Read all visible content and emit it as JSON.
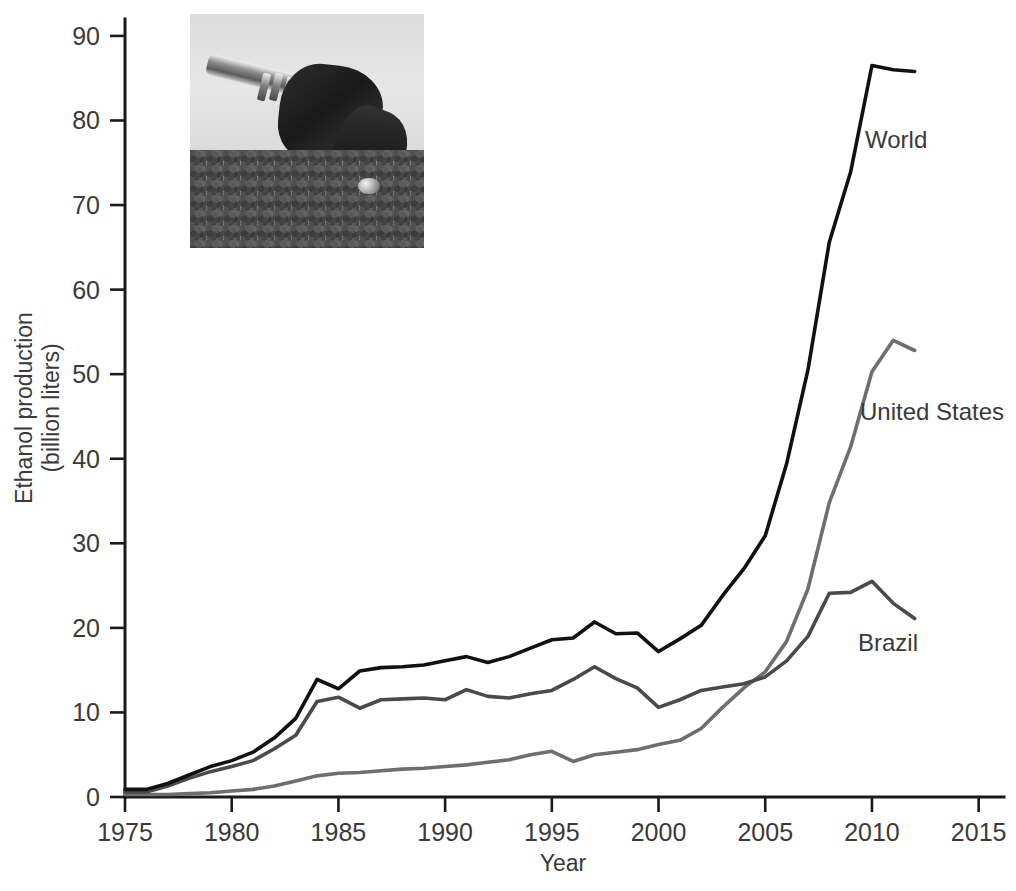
{
  "figure": {
    "background_color": "#ffffff",
    "inset_photo": {
      "name": "fuel-nozzle-on-corn-kernels-photo",
      "description": "Grayscale photograph of a fuel pump nozzle resting on a pile of grain kernels",
      "x": 190,
      "y": 14,
      "width": 234,
      "height": 234
    }
  },
  "chart_data": {
    "type": "line",
    "title": "",
    "xlabel": "Year",
    "ylabel": "Ethanol production (billion liters)",
    "ylabel_line1": "Ethanol production",
    "ylabel_line2": "(billion liters)",
    "xlim": [
      1975,
      2016
    ],
    "ylim": [
      0,
      92
    ],
    "xticks": [
      1975,
      1980,
      1985,
      1990,
      1995,
      2000,
      2005,
      2010,
      2015
    ],
    "xtick_labels": [
      "1975",
      "1980",
      "1985",
      "1990",
      "1995",
      "2000",
      "2005",
      "2010",
      "2015"
    ],
    "yticks": [
      0,
      10,
      20,
      30,
      40,
      50,
      60,
      70,
      80,
      90
    ],
    "ytick_labels": [
      "0",
      "10",
      "20",
      "30",
      "40",
      "50",
      "60",
      "70",
      "80",
      "90"
    ],
    "grid": false,
    "legend_position": "inline-labels-right",
    "x": [
      1975,
      1976,
      1977,
      1978,
      1979,
      1980,
      1981,
      1982,
      1983,
      1984,
      1985,
      1986,
      1987,
      1988,
      1989,
      1990,
      1991,
      1992,
      1993,
      1994,
      1995,
      1996,
      1997,
      1998,
      1999,
      2000,
      2001,
      2002,
      2003,
      2004,
      2005,
      2006,
      2007,
      2008,
      2009,
      2010,
      2011,
      2012
    ],
    "series": [
      {
        "name": "World",
        "color": "#111111",
        "stroke_width": 3.6,
        "label": "World",
        "label_x": 865,
        "label_y": 148,
        "values": [
          0.9,
          0.9,
          1.6,
          2.6,
          3.6,
          4.3,
          5.3,
          7.0,
          9.3,
          13.9,
          12.8,
          14.9,
          15.3,
          15.4,
          15.6,
          16.1,
          16.6,
          15.9,
          16.6,
          17.6,
          18.6,
          18.8,
          20.7,
          19.3,
          19.4,
          17.2,
          18.7,
          20.3,
          23.8,
          27.0,
          30.9,
          39.4,
          50.5,
          65.6,
          73.9,
          86.5,
          86.0,
          85.8
        ]
      },
      {
        "name": "United States",
        "color": "#6e6e6e",
        "stroke_width": 3.6,
        "label": "United States",
        "label_x": 860,
        "label_y": 420,
        "values": [
          0.3,
          0.3,
          0.3,
          0.4,
          0.5,
          0.7,
          0.9,
          1.3,
          1.9,
          2.5,
          2.8,
          2.9,
          3.1,
          3.3,
          3.4,
          3.6,
          3.8,
          4.1,
          4.4,
          5.0,
          5.4,
          4.2,
          5.0,
          5.3,
          5.6,
          6.2,
          6.7,
          8.1,
          10.6,
          12.9,
          14.8,
          18.4,
          24.6,
          34.8,
          41.4,
          50.3,
          54.0,
          52.8
        ]
      },
      {
        "name": "Brazil",
        "color": "#4a4a4a",
        "stroke_width": 3.6,
        "label": "Brazil",
        "label_x": 858,
        "label_y": 651,
        "values": [
          0.6,
          0.6,
          1.3,
          2.2,
          3.0,
          3.6,
          4.3,
          5.7,
          7.3,
          11.3,
          11.8,
          10.5,
          11.5,
          11.6,
          11.7,
          11.5,
          12.7,
          11.9,
          11.7,
          12.2,
          12.6,
          13.9,
          15.4,
          14.0,
          12.9,
          10.6,
          11.5,
          12.6,
          13.0,
          13.4,
          14.2,
          16.1,
          19.0,
          24.1,
          24.2,
          25.5,
          22.9,
          21.1
        ]
      }
    ],
    "axis": {
      "plot_left_px": 125,
      "plot_right_px": 1000,
      "plot_top_px": 19,
      "plot_bottom_px": 797,
      "axis_color": "#1a1a1a"
    }
  }
}
